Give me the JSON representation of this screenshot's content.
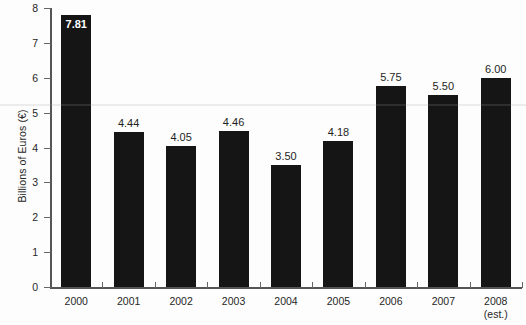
{
  "chart_data": {
    "type": "bar",
    "title": "",
    "subtitle": "",
    "xlabel": "",
    "ylabel": "Billions of Euros  (€)",
    "categories": [
      "2000",
      "2001",
      "2002",
      "2003",
      "2004",
      "2005",
      "2006",
      "2007",
      "2008"
    ],
    "category_sublabels": [
      "",
      "",
      "",
      "",
      "",
      "",
      "",
      "",
      "(est.)"
    ],
    "values": [
      7.81,
      4.44,
      4.05,
      4.46,
      3.5,
      4.18,
      5.75,
      5.5,
      6.0
    ],
    "value_labels": [
      "7.81",
      "4.44",
      "4.05",
      "4.46",
      "3.50",
      "4.18",
      "5.75",
      "5.50",
      "6.00"
    ],
    "ylim": [
      0,
      8
    ],
    "yticks": [
      0,
      1,
      2,
      3,
      4,
      5,
      6,
      7,
      8
    ],
    "ytick_labels": [
      "0",
      "1",
      "2",
      "3",
      "4",
      "5",
      "6",
      "7",
      "8"
    ],
    "grid": false,
    "legend": false,
    "legend_position": "none",
    "bar_color": "#151515",
    "axis_color": "#555555",
    "text_color": "#262626",
    "background_color": "#fdfdfd",
    "label_inside_bar_indices": [
      0
    ]
  }
}
